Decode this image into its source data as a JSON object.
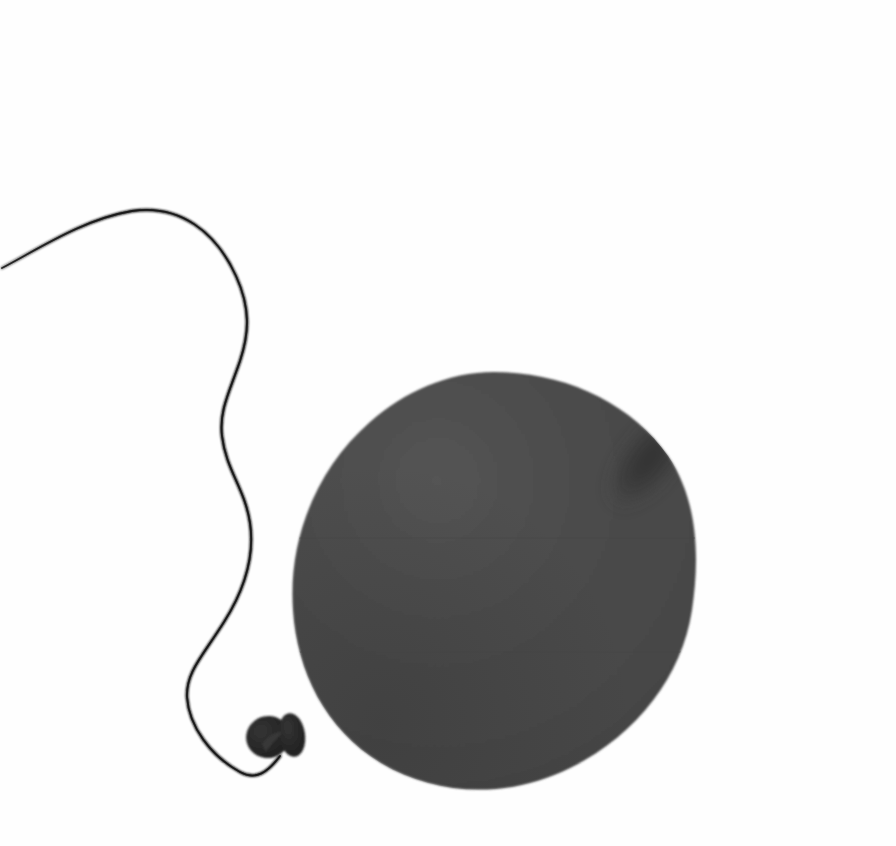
{
  "image": {
    "title": "Balloon",
    "subject": "balloon",
    "description": "A dark gray inflated party balloon with a knotted neck and a long curling string on a plain white background",
    "width": 896,
    "height": 846,
    "orientation": "landscape"
  },
  "background": {
    "name": "plain-white-backdrop",
    "color": "#fefefe"
  },
  "palette": {
    "background": "#fefefe",
    "balloon_body": "#4a4a4a",
    "balloon_body_light": "#525252",
    "balloon_body_dark": "#414141",
    "balloon_shadow_spot": "#383838",
    "balloon_edge_shade": "#3d3d3d",
    "knot": "#262626",
    "knot_highlight": "#3a3a3a",
    "string": "#141414",
    "seam_line": "#454545"
  },
  "balloon": {
    "name": "balloon",
    "label": "Balloon",
    "color": "#4a4a4a",
    "shape": "teardrop-oval",
    "bounds": {
      "left": 293,
      "top": 372,
      "right": 696,
      "bottom": 791
    },
    "center": {
      "x": 494,
      "y": 580
    },
    "width": 403,
    "height": 419,
    "rotation_deg": -8,
    "outline_path": "M 494 372 C 566 372 632 404 668 456 C 700 503 699 563 692 610 C 682 676 637 735 570 768 C 508 799 436 796 381 763 C 325 729 297 671 293 610 C 288 540 316 469 370 422 C 404 392 448 372 494 372 Z"
  },
  "specular": {
    "name": "balloon-shadow-spot",
    "label": "Dark specular patch",
    "color": "#383838",
    "center": {
      "x": 650,
      "y": 458
    },
    "radius_x": 30,
    "radius_y": 63,
    "rotation_deg": 38,
    "opacity": 0.92
  },
  "shading": {
    "name": "balloon-body-shading",
    "light_direction": "upper-left",
    "highlight_center": {
      "x": 430,
      "y": 470
    },
    "shadow_center": {
      "x": 400,
      "y": 760
    },
    "edge_darkening": true
  },
  "seams": {
    "name": "scan-seam-lines",
    "label": "Faint horizontal scan seams",
    "color": "#454545",
    "opacity": 0.5,
    "y_positions": [
      538,
      652
    ]
  },
  "knot": {
    "name": "balloon-knot",
    "label": "Knot",
    "color": "#262626",
    "bounds": {
      "left": 247,
      "top": 712,
      "right": 304,
      "bottom": 760
    },
    "lobes": [
      {
        "name": "knot-outer-lobe",
        "cx": 268,
        "cy": 737,
        "rx": 22,
        "ry": 21,
        "rotation_deg": -16
      },
      {
        "name": "knot-inner-lobe",
        "cx": 292,
        "cy": 735,
        "rx": 13,
        "ry": 22,
        "rotation_deg": -8
      }
    ],
    "crease": {
      "name": "knot-crease",
      "path": "M 262 744 C 268 736 276 731 282 733 C 276 739 270 746 266 752 Z",
      "color": "#3a3a3a"
    }
  },
  "string": {
    "name": "balloon-string",
    "label": "String",
    "color": "#141414",
    "tip": {
      "x": 2,
      "y": 268
    },
    "attach": {
      "x": 280,
      "y": 752
    },
    "crest": {
      "x": 132,
      "y": 211
    },
    "stroke_width_tip": 0.7,
    "stroke_width_max": 3.0,
    "path": "M 2 268 C 40 248 84 219 132 211 C 180 204 216 232 236 276 C 251 309 249 334 240 361 C 229 393 219 411 222 436 C 226 470 245 489 250 523 C 255 557 243 592 224 622 C 202 657 186 672 187 697 C 189 727 211 756 240 772 C 256 781 268 772 280 756",
    "segments": [
      {
        "name": "string-upper-sweep",
        "from": {
          "x": 2,
          "y": 268
        },
        "to": {
          "x": 236,
          "y": 276
        }
      },
      {
        "name": "string-s-curve",
        "from": {
          "x": 236,
          "y": 276
        },
        "to": {
          "x": 250,
          "y": 523
        }
      },
      {
        "name": "string-lower-loop",
        "from": {
          "x": 250,
          "y": 523
        },
        "to": {
          "x": 280,
          "y": 756
        }
      }
    ]
  }
}
